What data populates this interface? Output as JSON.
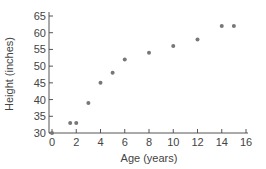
{
  "chart_data": {
    "type": "scatter",
    "title": "",
    "xlabel": "Age (years)",
    "ylabel": "Height (inches)",
    "xlim": [
      0,
      16
    ],
    "ylim": [
      30,
      65
    ],
    "xticks": [
      0,
      2,
      4,
      6,
      8,
      10,
      12,
      14,
      16
    ],
    "yticks": [
      30,
      35,
      40,
      45,
      50,
      55,
      60,
      65
    ],
    "grid": false,
    "legend": null,
    "series": [
      {
        "name": "Height vs Age",
        "color": "#777777",
        "points": [
          {
            "x": 0,
            "y": 30
          },
          {
            "x": 1.5,
            "y": 33
          },
          {
            "x": 2,
            "y": 33
          },
          {
            "x": 3,
            "y": 39
          },
          {
            "x": 4,
            "y": 45
          },
          {
            "x": 5,
            "y": 48
          },
          {
            "x": 6,
            "y": 52
          },
          {
            "x": 8,
            "y": 54
          },
          {
            "x": 10,
            "y": 56
          },
          {
            "x": 12,
            "y": 58
          },
          {
            "x": 14,
            "y": 62
          },
          {
            "x": 15,
            "y": 62
          }
        ]
      }
    ]
  }
}
